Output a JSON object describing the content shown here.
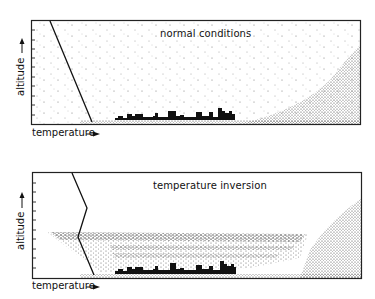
{
  "panels": [
    {
      "title": "normal conditions",
      "xlabel": "temperature",
      "ylabel": "altitude",
      "profile": "temperature decreases steadily with altitude",
      "pollution": "dispersed throughout atmosphere"
    },
    {
      "title": "temperature inversion",
      "xlabel": "temperature",
      "ylabel": "altitude",
      "profile": "temperature decreases then increases above inversion layer",
      "pollution": "trapped beneath inversion layer over city"
    }
  ],
  "colors": {
    "ink": "#111111",
    "background": "#ffffff"
  }
}
